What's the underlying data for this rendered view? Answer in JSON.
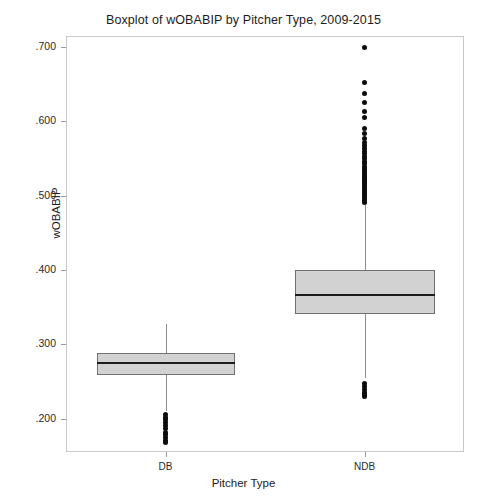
{
  "chart_data": {
    "type": "boxplot",
    "title": "Boxplot of wOBABIP by Pitcher Type, 2009-2015",
    "xlabel": "Pitcher Type",
    "ylabel": "wOBABIP",
    "categories": [
      "DB",
      "NDB"
    ],
    "ylim": [
      0.155,
      0.715
    ],
    "ytick_labels": [
      ".200",
      ".300",
      ".400",
      ".500",
      ".600",
      ".700"
    ],
    "ytick_values": [
      0.2,
      0.3,
      0.4,
      0.5,
      0.6,
      0.7
    ],
    "grid": false,
    "legend": "none",
    "boxes": [
      {
        "name": "DB",
        "whisker_low": 0.2105,
        "q1": 0.2585,
        "median": 0.2745,
        "q3": 0.2885,
        "whisker_high": 0.327,
        "outliers": [
          0.206,
          0.202,
          0.1985,
          0.195,
          0.1905,
          0.186,
          0.181,
          0.178,
          0.1745,
          0.1705,
          0.168
        ]
      },
      {
        "name": "NDB",
        "whisker_low": 0.2545,
        "q1": 0.3405,
        "median": 0.366,
        "q3": 0.4005,
        "whisker_high": 0.488,
        "outliers": [
          0.7,
          0.653,
          0.638,
          0.625,
          0.614,
          0.6055,
          0.59,
          0.5835,
          0.5775,
          0.572,
          0.568,
          0.564,
          0.56,
          0.5565,
          0.553,
          0.5495,
          0.546,
          0.543,
          0.54,
          0.537,
          0.534,
          0.531,
          0.5285,
          0.526,
          0.5235,
          0.521,
          0.5185,
          0.516,
          0.5135,
          0.511,
          0.5085,
          0.506,
          0.5035,
          0.501,
          0.4985,
          0.496,
          0.4935,
          0.4915,
          0.247,
          0.243,
          0.239,
          0.2355,
          0.232,
          0.23
        ]
      }
    ]
  },
  "axis": {
    "y_title": "wOBABIP",
    "x_title": "Pitcher Type"
  }
}
